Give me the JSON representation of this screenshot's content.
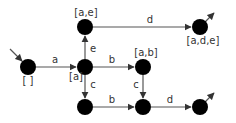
{
  "diagram": {
    "type": "state-transition-graph",
    "colors": {
      "node": "#000000",
      "edge": "#555555",
      "text": "#333333",
      "background": "#ffffff"
    },
    "nodes": [
      {
        "id": "n0",
        "label": "[ ]",
        "x": 28,
        "y": 67,
        "lx": 28,
        "ly": 84,
        "initial": true
      },
      {
        "id": "n1",
        "label": "[a]",
        "x": 85,
        "y": 67,
        "lx": 76,
        "ly": 80
      },
      {
        "id": "n2",
        "label": "[a,e]",
        "x": 85,
        "y": 27,
        "lx": 86,
        "ly": 16
      },
      {
        "id": "n3",
        "label": "[a,d,e]",
        "x": 200,
        "y": 27,
        "lx": 203,
        "ly": 44,
        "final": true
      },
      {
        "id": "n4",
        "label": "[a,b]",
        "x": 143,
        "y": 67,
        "lx": 146,
        "ly": 56
      },
      {
        "id": "n5",
        "label": "",
        "x": 85,
        "y": 107
      },
      {
        "id": "n6",
        "label": "",
        "x": 143,
        "y": 107
      },
      {
        "id": "n7",
        "label": "",
        "x": 200,
        "y": 107,
        "final": true
      }
    ],
    "edges": [
      {
        "from": "n0",
        "to": "n1",
        "label": "a",
        "lx": 55,
        "ly": 63
      },
      {
        "from": "n1",
        "to": "n2",
        "label": "e",
        "lx": 93,
        "ly": 52
      },
      {
        "from": "n2",
        "to": "n3",
        "label": "d",
        "lx": 150,
        "ly": 23
      },
      {
        "from": "n1",
        "to": "n4",
        "label": "b",
        "lx": 112,
        "ly": 63
      },
      {
        "from": "n1",
        "to": "n5",
        "label": "c",
        "lx": 93,
        "ly": 88
      },
      {
        "from": "n4",
        "to": "n6",
        "label": "c",
        "lx": 136,
        "ly": 88
      },
      {
        "from": "n5",
        "to": "n6",
        "label": "b",
        "lx": 112,
        "ly": 103
      },
      {
        "from": "n6",
        "to": "n7",
        "label": "d",
        "lx": 170,
        "ly": 103
      }
    ]
  }
}
